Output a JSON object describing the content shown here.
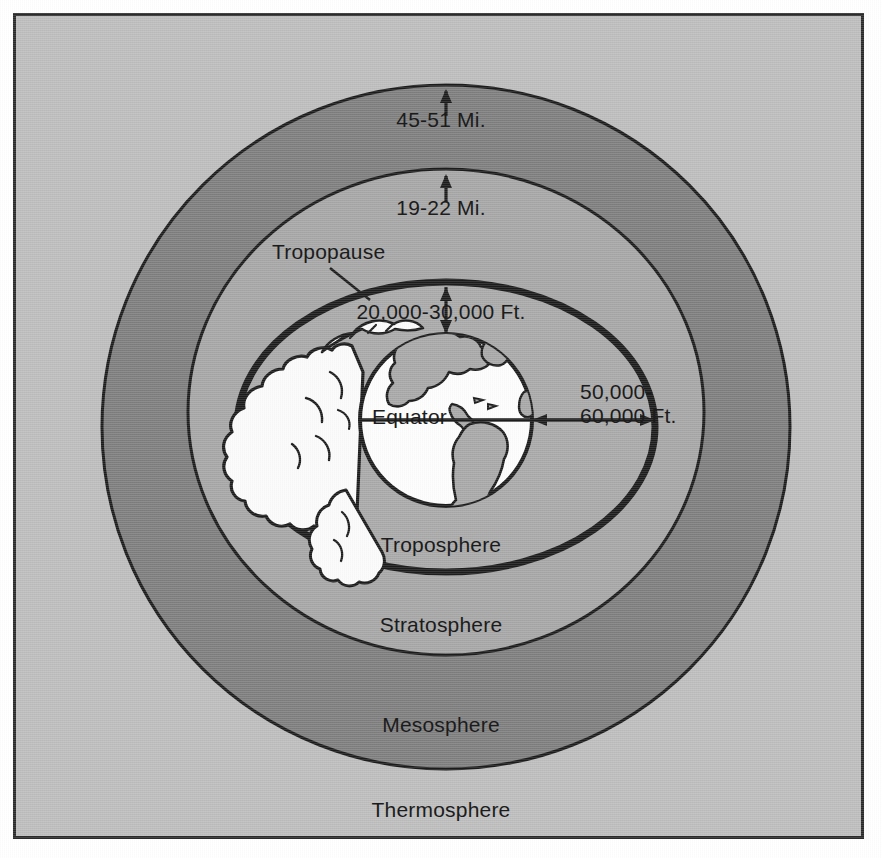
{
  "figure": {
    "kind": "atmosphere-layers-cross-section",
    "background_color": "#bdbdbd",
    "frame_color": "#2b2b2b"
  },
  "colors": {
    "thermosphere_band": "#bdbdbd",
    "mesosphere_band": "#7e7e7e",
    "stratosphere_band": "#a6a6a6",
    "troposphere_band": "#a9a9a9",
    "globe_ocean": "#fdfdfd",
    "globe_land": "#a8a8a8",
    "cloud": "#fbfbfb",
    "ink": "#1c1c1c"
  },
  "layers": [
    {
      "id": "thermosphere",
      "label": "Thermosphere"
    },
    {
      "id": "mesosphere",
      "label": "Mesosphere"
    },
    {
      "id": "stratosphere",
      "label": "Stratosphere"
    },
    {
      "id": "troposphere",
      "label": "Troposphere"
    }
  ],
  "annotations": {
    "tropopause": "Tropopause",
    "equator": "Equator"
  },
  "measurements": [
    {
      "id": "mesopause-altitude",
      "text": "45-51 Mi."
    },
    {
      "id": "stratopause-altitude",
      "text": "19-22 Mi."
    },
    {
      "id": "tropopause-polar",
      "text": "20,000-30,000 Ft."
    },
    {
      "id": "tropopause-equator",
      "text": "50,000-\n60,000 Ft."
    }
  ]
}
